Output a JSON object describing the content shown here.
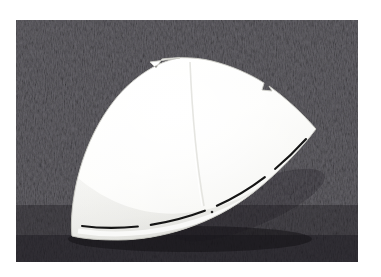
{
  "image": {
    "kind": "photograph",
    "width": 381,
    "height": 277,
    "caption_text": "",
    "frame": {
      "border_color": "#ffffff",
      "content_left": 16,
      "content_top": 20,
      "content_right": 358,
      "content_bottom": 262
    }
  },
  "background": {
    "name": "textured-fabric-surface",
    "base_color": "#66646a",
    "dark_color": "#3a383d",
    "light_color": "#8d8b91",
    "shadow_color": "#26242a",
    "texture": "fine diagonal fibrous weave"
  },
  "object": {
    "name": "white-dome-shell-fragment",
    "fill_color": "#fbfbf9",
    "shade_color": "#ececea",
    "edge_color": "#d8d8d4",
    "marking_color": "#1a1a1a",
    "description": "white curved dome shaped panel with pointed right tip",
    "apex_x": 195,
    "apex_y": 58,
    "left_x": 73,
    "left_y": 196,
    "bottom_left_x": 72,
    "bottom_left_y": 236,
    "right_tip_x": 316,
    "right_tip_y": 129
  },
  "markings": {
    "dashed_line": {
      "name": "dashed-guide-line",
      "color": "#141414",
      "segments": 4
    },
    "dot": {
      "name": "reference-dot",
      "color": "#2a2a2a",
      "x": 212,
      "y": 212
    },
    "seam": {
      "name": "center-crease-line",
      "color": "#e4e4e0"
    }
  },
  "notches": [
    {
      "name": "notch-top-left",
      "x": 152,
      "y": 63
    },
    {
      "name": "notch-upper-right",
      "x": 265,
      "y": 88
    }
  ]
}
